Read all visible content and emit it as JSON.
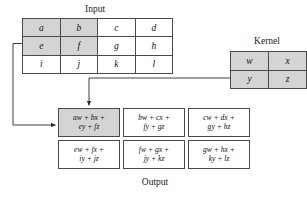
{
  "figure": {
    "type": "convolution-diagram",
    "colors": {
      "shade": "#d4d4d4",
      "border": "#4a4a4a",
      "text": "#111111",
      "background": "#ffffff",
      "connector": "#333333"
    }
  },
  "input": {
    "caption": "Input",
    "rows": 3,
    "cols": 4,
    "cells": [
      [
        {
          "label": "a",
          "shaded": true
        },
        {
          "label": "b",
          "shaded": true
        },
        {
          "label": "c",
          "shaded": false
        },
        {
          "label": "d",
          "shaded": false
        }
      ],
      [
        {
          "label": "e",
          "shaded": true
        },
        {
          "label": "f",
          "shaded": true
        },
        {
          "label": "g",
          "shaded": false
        },
        {
          "label": "h",
          "shaded": false
        }
      ],
      [
        {
          "label": "i",
          "shaded": false
        },
        {
          "label": "j",
          "shaded": false
        },
        {
          "label": "k",
          "shaded": false
        },
        {
          "label": "l",
          "shaded": false
        }
      ]
    ]
  },
  "kernel": {
    "caption": "Kernel",
    "rows": 2,
    "cols": 2,
    "cells": [
      [
        {
          "label": "w",
          "shaded": true
        },
        {
          "label": "x",
          "shaded": true
        }
      ],
      [
        {
          "label": "y",
          "shaded": true
        },
        {
          "label": "z",
          "shaded": true
        }
      ]
    ]
  },
  "output": {
    "caption": "Output",
    "rows": 2,
    "cols": 3,
    "cells": [
      [
        {
          "line1": "aw + bx +",
          "line2": "ey + fz",
          "shaded": true
        },
        {
          "line1": "bw + cx +",
          "line2": "fy + gz",
          "shaded": false
        },
        {
          "line1": "cw + dx +",
          "line2": "gy + hz",
          "shaded": false
        }
      ],
      [
        {
          "line1": "ew + fx +",
          "line2": "iy + jz",
          "shaded": false
        },
        {
          "line1": "fw + gx +",
          "line2": "jy + kz",
          "shaded": false
        },
        {
          "line1": "gw + hx +",
          "line2": "ky + lz",
          "shaded": false
        }
      ]
    ]
  },
  "connectors": [
    {
      "name": "input-to-output",
      "from": "input",
      "to": "output-cell-0-0",
      "direction": "right"
    },
    {
      "name": "kernel-to-output",
      "from": "kernel",
      "to": "output-cell-0-0",
      "direction": "down"
    }
  ]
}
